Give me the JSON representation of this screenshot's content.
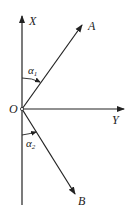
{
  "diagram": {
    "labels": {
      "x_axis": "X",
      "y_axis": "Y",
      "origin": "O",
      "vector_a": "A",
      "vector_b": "B",
      "angle_1": "α",
      "angle_1_sub": "1",
      "angle_2": "α",
      "angle_2_sub": "2"
    },
    "colors": {
      "stroke": "#222222",
      "background": "#ffffff"
    }
  }
}
